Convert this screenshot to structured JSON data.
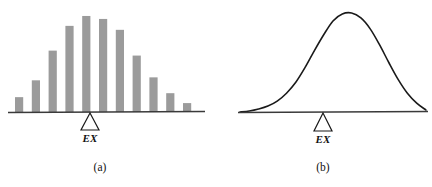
{
  "figure": {
    "background_color": "#ffffff",
    "width": 432,
    "height": 187,
    "ink_color": "#1a1a1a",
    "bar_color": "#9b9b9b",
    "baseline_color": "#3a3a3a"
  },
  "panels": [
    {
      "id": "a",
      "caption": "(a)",
      "mean_marker_label": "EX",
      "marker_shape": "triangle-outline"
    },
    {
      "id": "b",
      "caption": "(b)",
      "mean_marker_label": "EX",
      "marker_shape": "triangle-outline"
    }
  ],
  "chart_data": [
    {
      "type": "bar",
      "title": "",
      "subtitle": "",
      "xlabel": "",
      "ylabel": "",
      "panel": "(a)",
      "grid": false,
      "legend": null,
      "axis_line": "baseline-only",
      "categories": [
        "1",
        "2",
        "3",
        "4",
        "5",
        "6",
        "7",
        "8",
        "9",
        "10",
        "11"
      ],
      "values": [
        15,
        32,
        62,
        87,
        97,
        94,
        83,
        57,
        35,
        19,
        9
      ],
      "ylim": [
        0,
        100
      ],
      "annotations": [
        {
          "text": "EX",
          "x_category": "6",
          "position": "below-baseline",
          "marker": "triangle"
        }
      ]
    },
    {
      "type": "line",
      "title": "",
      "subtitle": "",
      "xlabel": "",
      "ylabel": "",
      "panel": "(b)",
      "grid": false,
      "legend": null,
      "axis_line": "baseline-only",
      "curve": "normal-density-bell",
      "x": [
        0,
        5,
        10,
        15,
        20,
        25,
        30,
        35,
        40,
        45,
        50,
        55,
        60,
        65,
        70,
        75,
        80,
        85,
        90,
        95,
        100
      ],
      "y": [
        0,
        1,
        3,
        6,
        11,
        19,
        30,
        45,
        62,
        78,
        92,
        99,
        100,
        95,
        84,
        68,
        50,
        33,
        19,
        9,
        2
      ],
      "ylim": [
        0,
        100
      ],
      "peak_x": 60,
      "annotations": [
        {
          "text": "EX",
          "x": 60,
          "position": "below-baseline",
          "marker": "triangle"
        }
      ]
    }
  ]
}
